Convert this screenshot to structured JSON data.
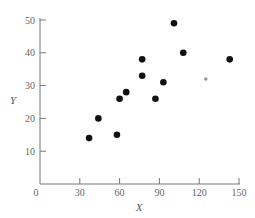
{
  "chart_data": {
    "type": "scatter",
    "title": "",
    "xlabel": "X",
    "ylabel": "Y",
    "xlim": [
      0,
      150
    ],
    "ylim": [
      0,
      50
    ],
    "x_ticks": [
      0,
      30,
      60,
      90,
      120,
      150
    ],
    "y_ticks": [
      10,
      20,
      30,
      40,
      50
    ],
    "grid": false,
    "legend": null,
    "series": [
      {
        "name": "observations",
        "marker": "filled-circle",
        "color": "#111111",
        "points": [
          {
            "x": 37,
            "y": 14
          },
          {
            "x": 44,
            "y": 20
          },
          {
            "x": 58,
            "y": 15
          },
          {
            "x": 60,
            "y": 26
          },
          {
            "x": 65,
            "y": 28
          },
          {
            "x": 77,
            "y": 38
          },
          {
            "x": 77,
            "y": 33
          },
          {
            "x": 87,
            "y": 26
          },
          {
            "x": 93,
            "y": 31
          },
          {
            "x": 101,
            "y": 49
          },
          {
            "x": 108,
            "y": 40
          },
          {
            "x": 143,
            "y": 38
          }
        ]
      },
      {
        "name": "highlighted point",
        "marker": "small-gray-circle",
        "color": "#999999",
        "points": [
          {
            "x": 125,
            "y": 32
          }
        ]
      }
    ]
  }
}
